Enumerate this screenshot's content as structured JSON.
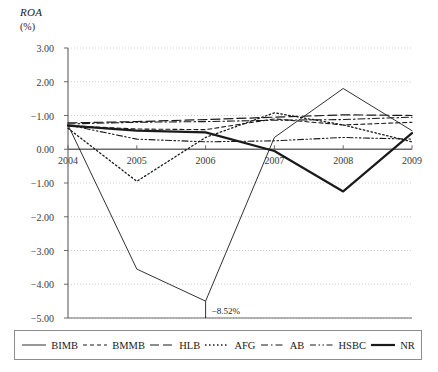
{
  "chart_data": {
    "type": "line",
    "title": "",
    "ylabel": "ROA",
    "yunit": "(%)",
    "xlabel": "",
    "x": [
      2004,
      2005,
      2006,
      2007,
      2008,
      2009
    ],
    "xticklabels": [
      "2004",
      "2005",
      "2006",
      "2007",
      "2008",
      "2009"
    ],
    "yticklabels": [
      "3.00",
      "2.00",
      "-1.00",
      "0.00",
      "-1.00",
      "-2.00",
      "-3.00",
      "-4.00",
      "-5.00"
    ],
    "ytickvalues": [
      3.0,
      2.0,
      1.0,
      0.0,
      -1.0,
      -2.0,
      -3.0,
      -4.0,
      -5.0
    ],
    "ylim": [
      -5.0,
      3.0
    ],
    "grid": "horizontal-dotted",
    "legend_position": "bottom",
    "annotations": [
      {
        "text": "-8.52%",
        "x": 2006,
        "y": -5.0
      }
    ],
    "series": [
      {
        "name": "BIMB",
        "style": "solid-thin",
        "values": [
          0.72,
          -3.55,
          -4.5,
          0.35,
          1.8,
          0.55
        ]
      },
      {
        "name": "BMMB",
        "style": "dashed",
        "values": [
          0.7,
          0.6,
          0.58,
          0.9,
          0.72,
          0.8
        ]
      },
      {
        "name": "HLB",
        "style": "long-dash",
        "values": [
          0.78,
          0.82,
          0.88,
          0.95,
          1.02,
          1.0
        ]
      },
      {
        "name": "AFG",
        "style": "dotted",
        "values": [
          0.62,
          -0.95,
          0.35,
          1.08,
          0.72,
          0.22
        ]
      },
      {
        "name": "AB",
        "style": "dash-dot",
        "values": [
          0.75,
          0.8,
          0.82,
          0.86,
          0.88,
          0.95
        ]
      },
      {
        "name": "HSBC",
        "style": "dash-dot-dot",
        "values": [
          0.72,
          0.3,
          0.22,
          0.25,
          0.35,
          0.3
        ]
      },
      {
        "name": "NR",
        "style": "solid-thick",
        "values": [
          0.7,
          0.55,
          0.5,
          -0.05,
          -1.25,
          0.48
        ]
      }
    ]
  },
  "legend": {
    "items": [
      {
        "label": "BIMB",
        "icon": "solid-thin-line-icon"
      },
      {
        "label": "BMMB",
        "icon": "dashed-line-icon"
      },
      {
        "label": "HLB",
        "icon": "long-dash-line-icon"
      },
      {
        "label": "AFG",
        "icon": "dotted-line-icon"
      },
      {
        "label": "AB",
        "icon": "dash-dot-line-icon"
      },
      {
        "label": "HSBC",
        "icon": "dash-dot-dot-line-icon"
      },
      {
        "label": "NR",
        "icon": "solid-thick-line-icon"
      }
    ]
  },
  "colors": {
    "line": "#1a1a1a",
    "grid": "#cfcfcf",
    "axis": "#6b6b6b",
    "text": "#1a1a1a"
  }
}
